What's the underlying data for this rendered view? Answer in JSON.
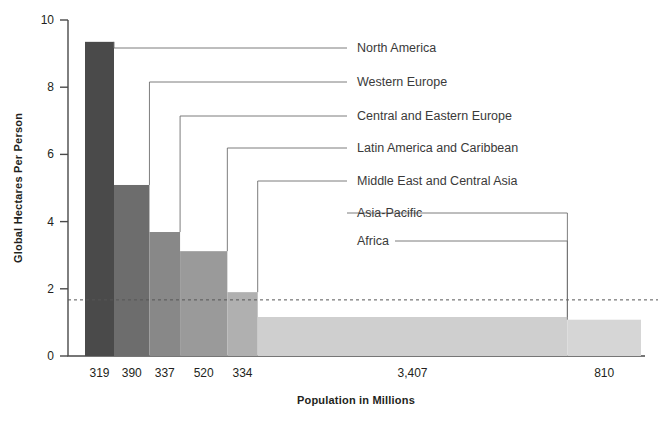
{
  "chart_data": {
    "type": "bar",
    "title": "",
    "subtitle": "",
    "xlabel": "Population in Millions",
    "ylabel": "Global Hectares Per Person",
    "xlim": [
      0,
      5317
    ],
    "ylim": [
      0,
      10
    ],
    "ytick_labels": [
      "0",
      "2",
      "4",
      "6",
      "8",
      "10"
    ],
    "ytick_values": [
      0,
      2,
      4,
      6,
      8,
      10
    ],
    "grid": false,
    "legend_position": "right-inline-leader-lines",
    "variable_width_bars": true,
    "x_axis_note": "Bar width is proportional to population; x tick labels sit under each bar.",
    "categories": [
      "North America",
      "Western Europe",
      "Central and Eastern Europe",
      "Latin America and Caribbean",
      "Middle East and Central Asia",
      "Asia-Pacific",
      "Africa"
    ],
    "populations_millions": [
      319,
      390,
      337,
      520,
      334,
      3407,
      810
    ],
    "population_labels": [
      "319",
      "390",
      "337",
      "520",
      "334",
      "3,407",
      "810"
    ],
    "values": [
      9.35,
      5.09,
      3.69,
      3.12,
      1.9,
      1.16,
      1.08
    ],
    "bar_colors": [
      "#4a4a4a",
      "#6d6d6d",
      "#888888",
      "#9a9a9a",
      "#b0b0b0",
      "#cfcfcf",
      "#d6d6d6"
    ],
    "annotations": [
      {
        "name": "world-average-biocapacity",
        "type": "horizontal-dashed-line",
        "value": 1.67,
        "label": ""
      }
    ]
  },
  "labels": {
    "y_axis_title": "Global Hectares Per Person",
    "x_axis_title": "Population in Millions"
  }
}
